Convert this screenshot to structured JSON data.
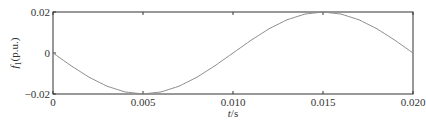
{
  "chart_data": {
    "type": "line",
    "title": "",
    "xlabel": "t/s",
    "xlabel_italic_part": "t",
    "xlabel_rest": "/s",
    "ylabel": "f1(p.u.)",
    "ylabel_main": "f",
    "ylabel_sub": "1",
    "ylabel_rest": "(p.u.)",
    "xlim": [
      0,
      0.02
    ],
    "ylim": [
      -0.02,
      0.02
    ],
    "grid": false,
    "legend": null,
    "x_ticks": [
      0,
      0.005,
      0.01,
      0.015,
      0.02
    ],
    "x_tick_labels": [
      "0",
      "0.005",
      "0.010",
      "0.015",
      "0.020"
    ],
    "y_ticks": [
      0.02,
      0,
      -0.02
    ],
    "y_tick_labels": [
      "0.02",
      "0",
      "−0.02"
    ],
    "series": [
      {
        "name": "f1",
        "color": "#8c8c8c",
        "x": [
          0,
          0.001,
          0.002,
          0.003,
          0.004,
          0.005,
          0.006,
          0.007,
          0.008,
          0.009,
          0.01,
          0.011,
          0.012,
          0.013,
          0.014,
          0.015,
          0.016,
          0.017,
          0.018,
          0.019,
          0.02
        ],
        "values": [
          0,
          -0.0062,
          -0.0118,
          -0.0162,
          -0.019,
          -0.02,
          -0.019,
          -0.0162,
          -0.0118,
          -0.0062,
          0,
          0.0062,
          0.0118,
          0.0162,
          0.019,
          0.02,
          0.019,
          0.0162,
          0.0118,
          0.0062,
          0
        ]
      }
    ]
  }
}
